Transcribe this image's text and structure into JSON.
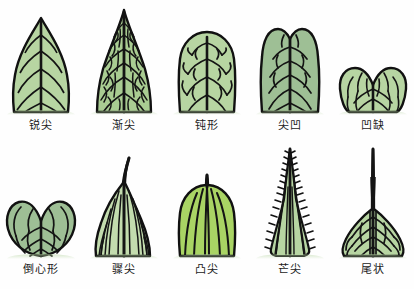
{
  "figure": {
    "title": "",
    "background_color": "#ffffff",
    "ink_color": "#111111",
    "rows": 2,
    "columns": 5
  },
  "palette": {
    "leaf_light_green": "#b7d5a2",
    "leaf_mid_green": "#a9cc92",
    "leaf_gray_green": "#9ebf95",
    "leaf_bright_green": "#a9d464",
    "leaf_pale_green": "#c3dcae",
    "vein_black": "#141414",
    "outline_black": "#111111",
    "label_text": "#1a1a1a"
  },
  "leaves": [
    {
      "index": 1,
      "row": "top",
      "label": "锐尖",
      "apex_type": "acute",
      "fill": "#b7d5a2",
      "venation": "pinnate",
      "tip": "pointed"
    },
    {
      "index": 2,
      "row": "top",
      "label": "渐尖",
      "apex_type": "acuminate",
      "fill": "#a9cc92",
      "venation": "reticulate",
      "tip": "long-tapering"
    },
    {
      "index": 3,
      "row": "top",
      "label": "钝形",
      "apex_type": "obtuse",
      "fill": "#b7d5a2",
      "venation": "pinnate-branched",
      "tip": "rounded"
    },
    {
      "index": 4,
      "row": "top",
      "label": "尖凹",
      "apex_type": "retuse",
      "fill": "#9ebf95",
      "venation": "pinnate",
      "tip": "small-notch"
    },
    {
      "index": 5,
      "row": "top",
      "label": "凹缺",
      "apex_type": "emarginate",
      "fill": "#b7d5a2",
      "venation": "pinnate",
      "tip": "deep-notch"
    },
    {
      "index": 6,
      "row": "bottom",
      "label": "倒心形",
      "apex_type": "obcordate",
      "fill": "#9ebf95",
      "venation": "pinnate-looped",
      "tip": "heart-notch"
    },
    {
      "index": 7,
      "row": "bottom",
      "label": "骤尖",
      "apex_type": "cuspidate",
      "fill": "#c3dcae",
      "venation": "parallel",
      "tip": "hooked-tail"
    },
    {
      "index": 8,
      "row": "bottom",
      "label": "凸尖",
      "apex_type": "mucronate",
      "fill": "#a9d464",
      "venation": "parallel",
      "tip": "short-mucro"
    },
    {
      "index": 9,
      "row": "bottom",
      "label": "芒尖",
      "apex_type": "aristate",
      "fill": "#b7d5a2",
      "venation": "parallel-bristled",
      "tip": "awn"
    },
    {
      "index": 10,
      "row": "bottom",
      "label": "尾状",
      "apex_type": "caudate",
      "fill": "#b7d5a2",
      "venation": "pinnate",
      "tip": "long-tail"
    }
  ]
}
